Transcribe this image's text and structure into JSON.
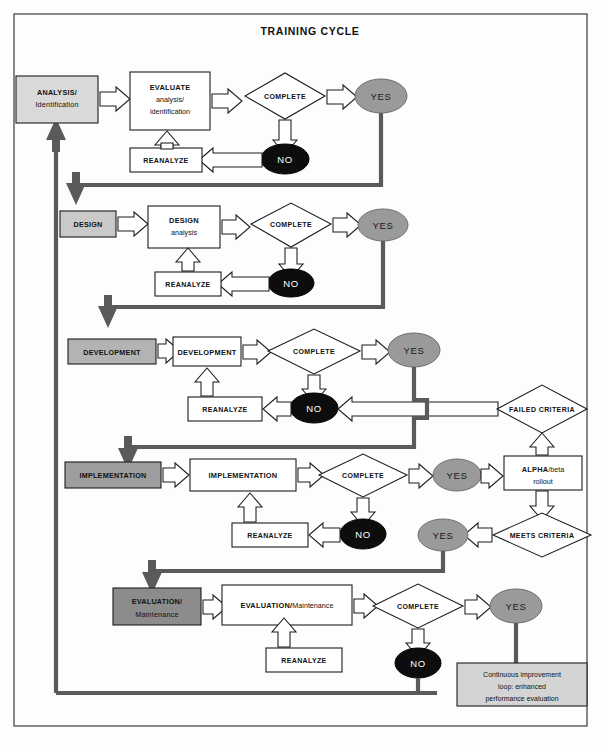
{
  "page": {
    "title": "TRAINING CYCLE",
    "diagram_type": "flowchart"
  },
  "colors": {
    "stage_1_fill": "#d9d9d9",
    "stage_2_fill": "#c9c9c9",
    "stage_3_fill": "#b3b3b3",
    "stage_4_fill": "#9e9e9e",
    "stage_5_fill": "#8c8c8c",
    "yes_fill": "#9a9a9a",
    "no_fill": "#0d0d0d",
    "note_fill": "#d4d4d4",
    "flow_line": "#5a5a5a",
    "outline": "#1c1c1c"
  },
  "labels": {
    "complete": "COMPLETE",
    "yes": "YES",
    "no": "NO",
    "reanalyze": "REANALYZE",
    "failed_criteria": "FAILED CRITERIA",
    "meets_criteria": "MEETS CRITERIA"
  },
  "rows": [
    {
      "id": "analysis",
      "stage_line1": "ANALYSIS/",
      "stage_line2": "Identification",
      "process_line1": "EVALUATE",
      "process_line2": "analysis/",
      "process_line3": "identification",
      "decision": "COMPLETE",
      "yes": "YES",
      "no": "NO",
      "reanalyze": "REANALYZE"
    },
    {
      "id": "design",
      "stage_line1": "DESIGN",
      "stage_line2": "",
      "process_line1": "DESIGN",
      "process_line2": "analysis",
      "process_line3": "",
      "decision": "COMPLETE",
      "yes": "YES",
      "no": "NO",
      "reanalyze": "REANALYZE"
    },
    {
      "id": "development",
      "stage_line1": "DEVELOPMENT",
      "stage_line2": "",
      "process_line1": "DEVELOPMENT",
      "process_line2": "",
      "process_line3": "",
      "decision": "COMPLETE",
      "yes": "YES",
      "no": "NO",
      "reanalyze": "REANALYZE"
    },
    {
      "id": "implementation",
      "stage_line1": "IMPLEMENTATION",
      "stage_line2": "",
      "process_line1": "IMPLEMENTATION",
      "process_line2": "",
      "process_line3": "",
      "decision": "COMPLETE",
      "yes": "YES",
      "no": "NO",
      "reanalyze": "REANALYZE"
    },
    {
      "id": "evaluation",
      "stage_line1": "EVALUATION/",
      "stage_line2": "Maintenance",
      "process_line1": "EVALUATION/",
      "process_line2": "Maintenance",
      "process_line3": "",
      "decision": "COMPLETE",
      "yes": "YES",
      "no": "NO",
      "reanalyze": "REANALYZE"
    }
  ],
  "side_branch": {
    "failed_criteria": "FAILED CRITERIA",
    "rollout_line1": "ALPHA",
    "rollout_line1b": "/beta",
    "rollout_line2": "rollout",
    "meets_criteria": "MEETS CRITERIA",
    "meets_yes": "YES"
  },
  "note": {
    "line1": "Continuous improvement",
    "line2": "loop: enhanced",
    "line3": "performance evaluation"
  }
}
